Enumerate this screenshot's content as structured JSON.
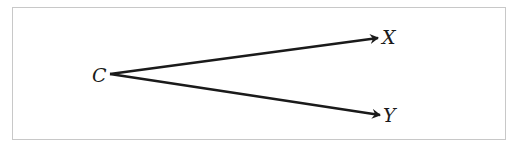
{
  "diagram": {
    "type": "directed-graph",
    "nodes": [
      {
        "id": "C",
        "label": "C",
        "x": 100,
        "y": 81
      },
      {
        "id": "X",
        "label": "X",
        "x": 391,
        "y": 44
      },
      {
        "id": "Y",
        "label": "Y",
        "x": 392,
        "y": 121
      }
    ],
    "edges": [
      {
        "from": "C",
        "to": "X",
        "x1": 110,
        "y1": 74,
        "x2": 378,
        "y2": 38
      },
      {
        "from": "C",
        "to": "Y",
        "x1": 110,
        "y1": 74,
        "x2": 380,
        "y2": 115
      }
    ],
    "colors": {
      "line": "#1a1a1a",
      "border": "#c8c8c8"
    }
  }
}
